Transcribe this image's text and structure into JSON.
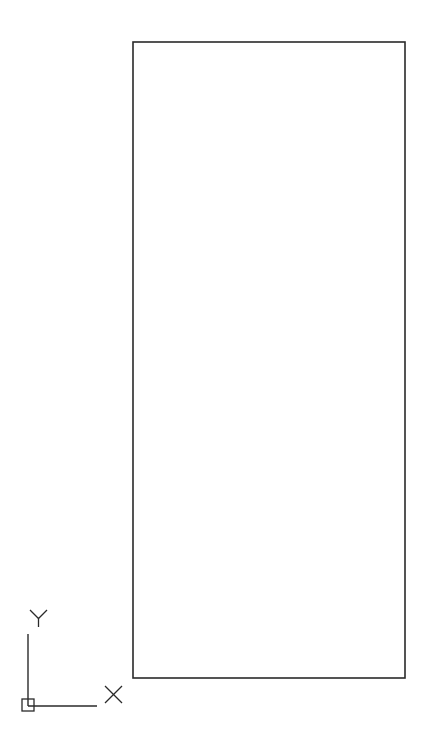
{
  "drawing": {
    "background": "#ffffff",
    "stroke_color": "#2a2a2a",
    "rectangle": {
      "x": 133,
      "y": 42,
      "width": 272,
      "height": 636
    }
  },
  "ucs_icon": {
    "x_label": "X",
    "y_label": "Y",
    "origin": {
      "x": 28,
      "y": 706
    },
    "x_axis_end": 97,
    "y_axis_top": 634
  }
}
